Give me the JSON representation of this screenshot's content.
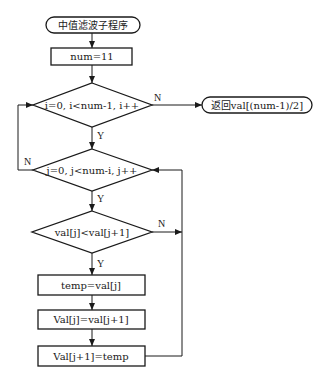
{
  "diagram": {
    "type": "flowchart",
    "nodes": {
      "start": "中值滤波子程序",
      "init": "num=11",
      "outer_loop": "i=0,  i<num-1, i++",
      "return": "返回val[(num-1)/2]",
      "inner_loop": "j=0,  j<num-i, j++",
      "compare": "val[j]<val[j+1]",
      "step1": "temp=val[j]",
      "step2": "Val[j]=val[j+1]",
      "step3": "Val[j+1]=temp"
    },
    "edge_labels": {
      "outer_no": "N",
      "outer_yes": "Y",
      "inner_no": "N",
      "inner_yes": "Y",
      "compare_no": "N",
      "compare_yes": "Y"
    },
    "colors": {
      "stroke": "#1a1a1a",
      "background": "#ffffff"
    }
  }
}
